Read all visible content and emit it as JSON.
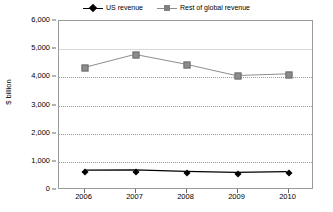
{
  "chart_data": {
    "type": "line",
    "title": "",
    "xlabel": "",
    "ylabel": "$ billion",
    "categories": [
      "2006",
      "2007",
      "2008",
      "2009",
      "2010"
    ],
    "ylim": [
      0,
      6000
    ],
    "ytick_labels": [
      "0",
      "1,000",
      "2,000",
      "3,000",
      "4,000",
      "5,000",
      "6,000"
    ],
    "ytick_values": [
      0,
      1000,
      2000,
      3000,
      4000,
      5000,
      6000
    ],
    "grid": true,
    "legend_position": "top-right",
    "series": [
      {
        "name": "US revenue",
        "color": "#000000",
        "marker": "diamond",
        "values": [
          640,
          650,
          600,
          560,
          590
        ]
      },
      {
        "name": "Rest of global revenue",
        "color": "#8c8c8c",
        "marker": "square",
        "values": [
          4330,
          4800,
          4450,
          4040,
          4100
        ]
      }
    ]
  },
  "legend": {
    "items": [
      {
        "label": "US revenue",
        "marker": "diamond-marker-icon"
      },
      {
        "label": "Rest of global revenue",
        "marker": "square-marker-icon"
      }
    ]
  }
}
